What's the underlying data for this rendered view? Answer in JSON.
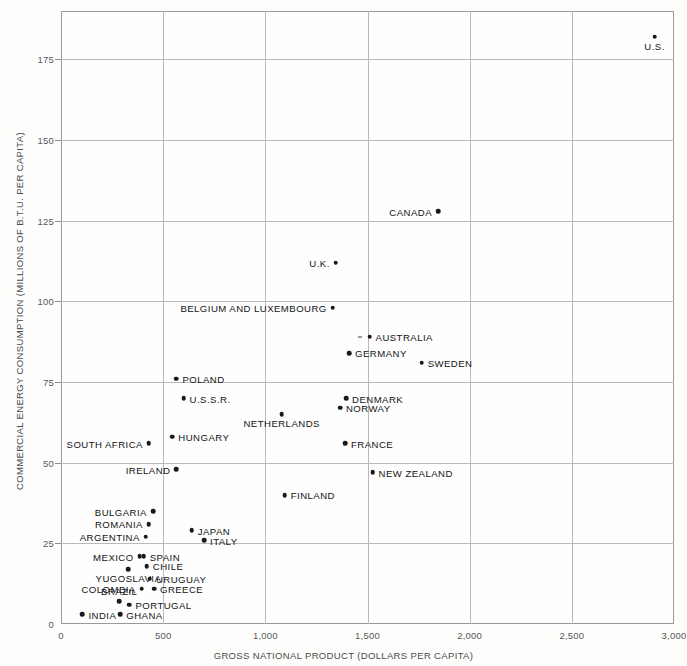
{
  "chart_data": {
    "type": "scatter",
    "title": "",
    "xlabel": "GROSS NATIONAL PRODUCT (DOLLARS PER CAPITA)",
    "ylabel": "COMMERCIAL ENERGY CONSUMPTION (MILLIONS OF B.T.U. PER CAPITA)",
    "xlim": [
      0,
      3000
    ],
    "ylim": [
      0,
      190
    ],
    "xticks": [
      0,
      500,
      1000,
      1500,
      2000,
      2500,
      3000
    ],
    "xticklabels": [
      "0",
      "500",
      "1,000",
      "1,500",
      "2,000",
      "2,500",
      "3,000"
    ],
    "yticks": [
      0,
      25,
      50,
      75,
      100,
      125,
      150,
      175
    ],
    "yticklabels": [
      "0",
      "25",
      "50",
      "75",
      "100",
      "125",
      "150",
      "175"
    ],
    "grid": true,
    "legend": false,
    "marker_color": "#18191b",
    "grid_color": "#b9b9b9",
    "points": [
      {
        "label": "U.S.",
        "x": 2905,
        "y": 182,
        "pos": "below"
      },
      {
        "label": "CANADA",
        "x": 1845,
        "y": 128,
        "pos": "left"
      },
      {
        "label": "U.K.",
        "x": 1345,
        "y": 112,
        "pos": "left"
      },
      {
        "label": "BELGIUM AND LUXEMBOURG",
        "x": 1330,
        "y": 98,
        "pos": "left"
      },
      {
        "label": "AUSTRALIA",
        "x": 1510,
        "y": 89,
        "pos": "right"
      },
      {
        "label": "GERMANY",
        "x": 1410,
        "y": 84,
        "pos": "right"
      },
      {
        "label": "SWEDEN",
        "x": 1765,
        "y": 81,
        "pos": "right"
      },
      {
        "label": "POLAND",
        "x": 565,
        "y": 76,
        "pos": "right"
      },
      {
        "label": "U.S.S.R.",
        "x": 600,
        "y": 70,
        "pos": "right"
      },
      {
        "label": "DENMARK",
        "x": 1395,
        "y": 70,
        "pos": "right"
      },
      {
        "label": "NORWAY",
        "x": 1365,
        "y": 67,
        "pos": "right"
      },
      {
        "label": "NETHERLANDS",
        "x": 1080,
        "y": 65,
        "pos": "below"
      },
      {
        "label": "HUNGARY",
        "x": 545,
        "y": 58,
        "pos": "right"
      },
      {
        "label": "SOUTH AFRICA",
        "x": 430,
        "y": 56,
        "pos": "left"
      },
      {
        "label": "FRANCE",
        "x": 1390,
        "y": 56,
        "pos": "right"
      },
      {
        "label": "IRELAND",
        "x": 565,
        "y": 48,
        "pos": "left"
      },
      {
        "label": "NEW ZEALAND",
        "x": 1525,
        "y": 47,
        "pos": "right"
      },
      {
        "label": "FINLAND",
        "x": 1095,
        "y": 40,
        "pos": "right"
      },
      {
        "label": "BULGARIA",
        "x": 450,
        "y": 35,
        "pos": "left"
      },
      {
        "label": "ROMANIA",
        "x": 430,
        "y": 31,
        "pos": "left"
      },
      {
        "label": "JAPAN",
        "x": 640,
        "y": 29,
        "pos": "right"
      },
      {
        "label": "ARGENTINA",
        "x": 415,
        "y": 27,
        "pos": "left"
      },
      {
        "label": "ITALY",
        "x": 700,
        "y": 26,
        "pos": "right"
      },
      {
        "label": "MEXICO",
        "x": 385,
        "y": 21,
        "pos": "left"
      },
      {
        "label": "SPAIN",
        "x": 405,
        "y": 21,
        "pos": "right"
      },
      {
        "label": "CHILE",
        "x": 420,
        "y": 18,
        "pos": "right"
      },
      {
        "label": "YUGOSLAVIA",
        "x": 330,
        "y": 17,
        "pos": "below"
      },
      {
        "label": "URUGUAY",
        "x": 435,
        "y": 14,
        "pos": "right"
      },
      {
        "label": "COLOMBIA",
        "x": 395,
        "y": 11,
        "pos": "left"
      },
      {
        "label": "GREECE",
        "x": 455,
        "y": 11,
        "pos": "right"
      },
      {
        "label": "BRAZIL",
        "x": 285,
        "y": 7,
        "pos": "above"
      },
      {
        "label": "PORTUGAL",
        "x": 335,
        "y": 6,
        "pos": "right"
      },
      {
        "label": "INDIA",
        "x": 105,
        "y": 3,
        "pos": "right"
      },
      {
        "label": "GHANA",
        "x": 290,
        "y": 3,
        "pos": "right"
      }
    ]
  }
}
